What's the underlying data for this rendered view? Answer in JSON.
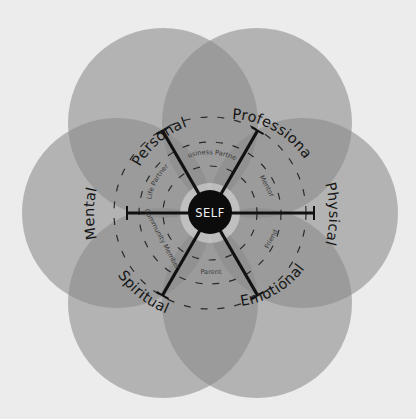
{
  "diagram": {
    "center": {
      "label": "SELF"
    },
    "domains": [
      {
        "id": "personal",
        "label": "Personal",
        "angle": -120
      },
      {
        "id": "professional",
        "label": "Professional",
        "angle": -60
      },
      {
        "id": "physical",
        "label": "Physical",
        "angle": 0
      },
      {
        "id": "emotional",
        "label": "Emotional",
        "angle": 60
      },
      {
        "id": "spiritual",
        "label": "Spiritual",
        "angle": 120
      },
      {
        "id": "mental",
        "label": "Mental",
        "angle": 180
      }
    ],
    "relationships": [
      {
        "id": "life-partner",
        "label": "Life Partner",
        "between": [
          "mental",
          "personal"
        ]
      },
      {
        "id": "business-partner",
        "label": "Business Partner",
        "between": [
          "personal",
          "professional"
        ]
      },
      {
        "id": "mentor",
        "label": "Mentor",
        "between": [
          "professional",
          "physical"
        ]
      },
      {
        "id": "friend",
        "label": "Friend",
        "between": [
          "physical",
          "emotional"
        ]
      },
      {
        "id": "parent",
        "label": "Parent",
        "between": [
          "emotional",
          "spiritual"
        ]
      },
      {
        "id": "community-member",
        "label": "Community Member",
        "between": [
          "spiritual",
          "mental"
        ]
      }
    ],
    "colors": {
      "background": "#ececec",
      "circle_fill": "#8c8c8c",
      "self_fill": "#0c0c0c",
      "spoke": "#111111",
      "dash": "#2a2a2a"
    }
  }
}
